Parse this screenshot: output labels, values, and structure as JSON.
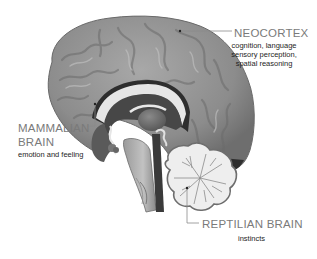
{
  "diagram": {
    "labels": {
      "neocortex": {
        "title": "NEOCORTEX",
        "description_lines": [
          "cognition, language",
          "sensory perception,",
          "spatial reasoning"
        ]
      },
      "mammalian": {
        "title_lines": [
          "MAMMALIAN",
          "BRAIN"
        ],
        "description": "emotion and feeling"
      },
      "reptilian": {
        "title": "REPTILIAN BRAIN",
        "description": "instincts"
      }
    },
    "colors": {
      "cortex": "#8f8f8f",
      "cortex_dark": "#5e5e5e",
      "inner_dark": "#4a4a4a",
      "white_matter": "#e8e8e8",
      "label_title": "#7a7a7a",
      "label_desc": "#1e1e1e",
      "leader_line": "#8a8a8a"
    }
  }
}
